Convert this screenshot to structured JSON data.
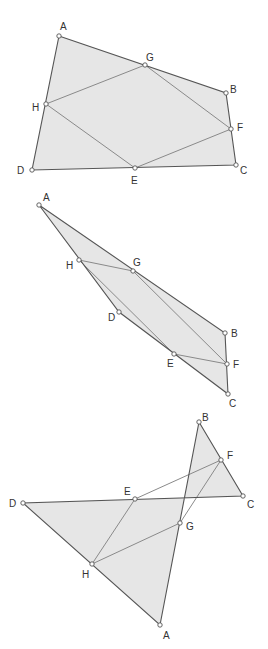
{
  "colors": {
    "fill": "#e6e6e6",
    "edge": "#555555",
    "midline": "#8a8a8a",
    "label": "#333333"
  },
  "figures": [
    {
      "name": "convex",
      "points": {
        "A": {
          "x": 59,
          "y": 36,
          "label": "A",
          "lx": 60,
          "ly": 30
        },
        "B": {
          "x": 226,
          "y": 93,
          "label": "B",
          "lx": 230,
          "ly": 93
        },
        "C": {
          "x": 236,
          "y": 165,
          "label": "C",
          "lx": 240,
          "ly": 174
        },
        "D": {
          "x": 32,
          "y": 170,
          "label": "D",
          "lx": 17,
          "ly": 174
        },
        "E": {
          "x": 135,
          "y": 168,
          "label": "E",
          "lx": 131,
          "ly": 184
        },
        "F": {
          "x": 231,
          "y": 129,
          "label": "F",
          "lx": 237,
          "ly": 131
        },
        "G": {
          "x": 145,
          "y": 65,
          "label": "G",
          "lx": 146,
          "ly": 61
        },
        "H": {
          "x": 46,
          "y": 104,
          "label": "H",
          "lx": 32,
          "ly": 111
        }
      }
    },
    {
      "name": "concave",
      "points": {
        "A": {
          "x": 39,
          "y": 205,
          "label": "A",
          "lx": 43,
          "ly": 201
        },
        "B": {
          "x": 225,
          "y": 333,
          "label": "B",
          "lx": 231,
          "ly": 337
        },
        "C": {
          "x": 228,
          "y": 394,
          "label": "C",
          "lx": 229,
          "ly": 407
        },
        "D": {
          "x": 119,
          "y": 312,
          "label": "D",
          "lx": 108,
          "ly": 321
        },
        "E": {
          "x": 174,
          "y": 354,
          "label": "E",
          "lx": 167,
          "ly": 367
        },
        "F": {
          "x": 227,
          "y": 364,
          "label": "F",
          "lx": 233,
          "ly": 368
        },
        "G": {
          "x": 133,
          "y": 271,
          "label": "G",
          "lx": 133,
          "ly": 266
        },
        "H": {
          "x": 79,
          "y": 260,
          "label": "H",
          "lx": 66,
          "ly": 269
        }
      }
    },
    {
      "name": "crossed",
      "points": {
        "A": {
          "x": 160,
          "y": 625,
          "label": "A",
          "lx": 163,
          "ly": 639
        },
        "B": {
          "x": 199,
          "y": 422,
          "label": "B",
          "lx": 202,
          "ly": 421
        },
        "C": {
          "x": 243,
          "y": 496,
          "label": "C",
          "lx": 247,
          "ly": 508
        },
        "D": {
          "x": 23,
          "y": 503,
          "label": "D",
          "lx": 9,
          "ly": 507
        },
        "E": {
          "x": 135,
          "y": 499,
          "label": "E",
          "lx": 124,
          "ly": 495
        },
        "F": {
          "x": 221,
          "y": 460,
          "label": "F",
          "lx": 227,
          "ly": 459
        },
        "G": {
          "x": 180,
          "y": 523,
          "label": "G",
          "lx": 186,
          "ly": 530
        },
        "H": {
          "x": 92,
          "y": 564,
          "label": "H",
          "lx": 82,
          "ly": 578
        }
      }
    }
  ]
}
